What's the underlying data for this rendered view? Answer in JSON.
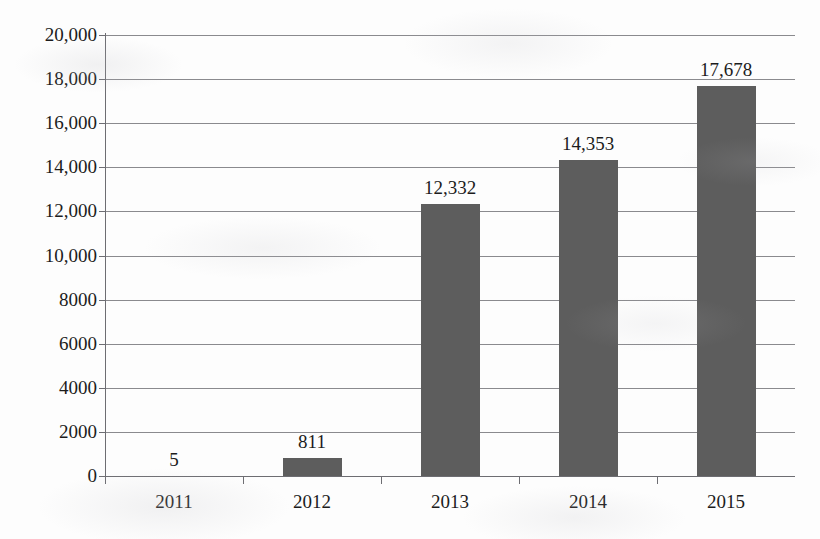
{
  "chart_data": {
    "type": "bar",
    "title": "",
    "xlabel": "",
    "ylabel": "",
    "categories": [
      "2011",
      "2012",
      "2013",
      "2014",
      "2015"
    ],
    "values": [
      5,
      811,
      12332,
      14353,
      17678
    ],
    "value_labels": [
      "5",
      "811",
      "12,332",
      "14,353",
      "17,678"
    ],
    "series": [
      {
        "name": "",
        "values": [
          5,
          811,
          12332,
          14353,
          17678
        ]
      }
    ],
    "ylim": [
      0,
      20000
    ],
    "ytick_values": [
      0,
      2000,
      4000,
      6000,
      8000,
      10000,
      12000,
      14000,
      16000,
      18000,
      20000
    ],
    "ytick_labels": [
      "0",
      "2000",
      "4000",
      "6000",
      "8000",
      "10,000",
      "12,000",
      "14,000",
      "16,000",
      "18,000",
      "20,000"
    ],
    "grid": true,
    "legend": false,
    "legend_position": "none",
    "bar_color": "#5d5d5d",
    "gridline_color": "#8a8a8e",
    "axis_color": "#6d6d72",
    "background_color": "#fdfdfd"
  }
}
